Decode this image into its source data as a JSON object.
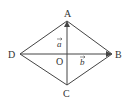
{
  "diagram": {
    "type": "rhombus-with-diagonals",
    "stroke_color": "#444444",
    "points": {
      "A": {
        "label": "A",
        "x": 67,
        "y": 21
      },
      "B": {
        "label": "B",
        "x": 112,
        "y": 54
      },
      "C": {
        "label": "C",
        "x": 67,
        "y": 85
      },
      "D": {
        "label": "D",
        "x": 20,
        "y": 54
      },
      "O": {
        "label": "O",
        "x": 67,
        "y": 54
      }
    },
    "vectors": [
      {
        "name": "a",
        "label": "a",
        "from": "O",
        "to": "A"
      },
      {
        "name": "b",
        "label": "b",
        "from": "O",
        "to": "B"
      }
    ],
    "edges": [
      "AB",
      "BC",
      "CD",
      "DA",
      "AC",
      "DB"
    ]
  }
}
